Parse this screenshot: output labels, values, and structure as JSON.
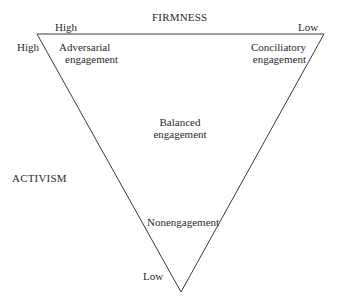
{
  "axes": {
    "top_title": "FIRMNESS",
    "top_left": "High",
    "top_right": "Low",
    "left_title": "ACTIVISM",
    "left_high": "High",
    "left_low": "Low"
  },
  "regions": {
    "adversarial": [
      "Adversarial",
      "engagement"
    ],
    "conciliatory": [
      "Conciliatory",
      "engagement"
    ],
    "balanced": [
      "Balanced",
      "engagement"
    ],
    "nonengagement": "Nonengagement"
  },
  "colors": {
    "line": "#3a3a3a",
    "text": "#2a2a2a",
    "background": "#ffffff"
  }
}
